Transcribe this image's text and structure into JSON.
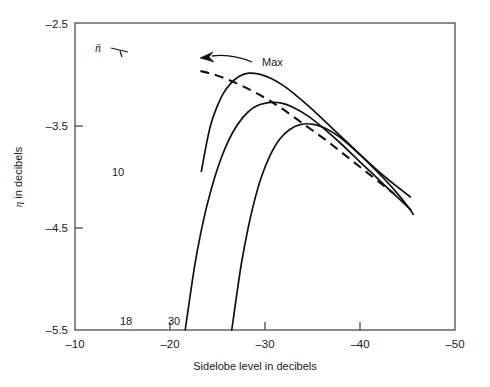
{
  "chart_data": {
    "type": "line",
    "title": "",
    "xlabel": "Sidelobe level in decibels",
    "ylabel": "η in decibels",
    "xlim": [
      -10,
      -50
    ],
    "ylim": [
      -5.5,
      -2.5
    ],
    "xticks": [
      -10,
      -20,
      -30,
      -40,
      -50
    ],
    "xtick_labels": [
      "–10",
      "–20",
      "–30",
      "–40",
      "–50"
    ],
    "yticks": [
      -2.5,
      -3.5,
      -4.5,
      -5.5
    ],
    "ytick_labels": [
      "–2.5",
      "–3.5",
      "–4.5",
      "–5.5"
    ],
    "grid": false,
    "legend_position": "inline-curve-labels",
    "parameter_symbol": "n̄",
    "series": [
      {
        "name": "10",
        "label": "10",
        "style": "solid",
        "points": [
          [
            -23.3,
            -3.95
          ],
          [
            -23.8,
            -3.7
          ],
          [
            -24.3,
            -3.49
          ],
          [
            -24.9,
            -3.33
          ],
          [
            -25.6,
            -3.19
          ],
          [
            -26.4,
            -3.09
          ],
          [
            -27.3,
            -3.02
          ],
          [
            -28.3,
            -2.99
          ],
          [
            -29.4,
            -3.0
          ],
          [
            -30.6,
            -3.04
          ],
          [
            -31.9,
            -3.11
          ],
          [
            -33.3,
            -3.21
          ],
          [
            -34.8,
            -3.33
          ],
          [
            -36.3,
            -3.46
          ],
          [
            -37.9,
            -3.6
          ],
          [
            -39.5,
            -3.74
          ],
          [
            -41.1,
            -3.88
          ],
          [
            -42.7,
            -4.01
          ],
          [
            -44.2,
            -4.12
          ],
          [
            -45.3,
            -4.2
          ]
        ]
      },
      {
        "name": "18",
        "label": "18",
        "style": "solid",
        "points": [
          [
            -21.6,
            -5.5
          ],
          [
            -22.1,
            -5.18
          ],
          [
            -22.6,
            -4.87
          ],
          [
            -23.2,
            -4.57
          ],
          [
            -23.9,
            -4.28
          ],
          [
            -24.7,
            -4.01
          ],
          [
            -25.6,
            -3.77
          ],
          [
            -26.6,
            -3.57
          ],
          [
            -27.7,
            -3.42
          ],
          [
            -28.9,
            -3.32
          ],
          [
            -30.2,
            -3.28
          ],
          [
            -31.6,
            -3.28
          ],
          [
            -33.1,
            -3.33
          ],
          [
            -34.7,
            -3.42
          ],
          [
            -36.3,
            -3.54
          ],
          [
            -38.0,
            -3.68
          ],
          [
            -39.7,
            -3.83
          ],
          [
            -41.4,
            -3.98
          ],
          [
            -43.1,
            -4.13
          ],
          [
            -44.6,
            -4.26
          ],
          [
            -45.4,
            -4.33
          ]
        ]
      },
      {
        "name": "30",
        "label": "30",
        "style": "solid",
        "points": [
          [
            -26.5,
            -5.5
          ],
          [
            -27.0,
            -5.17
          ],
          [
            -27.5,
            -4.86
          ],
          [
            -28.1,
            -4.56
          ],
          [
            -28.8,
            -4.27
          ],
          [
            -29.6,
            -4.01
          ],
          [
            -30.5,
            -3.8
          ],
          [
            -31.5,
            -3.64
          ],
          [
            -32.6,
            -3.54
          ],
          [
            -33.8,
            -3.49
          ],
          [
            -35.1,
            -3.49
          ],
          [
            -36.4,
            -3.53
          ],
          [
            -37.8,
            -3.61
          ],
          [
            -39.2,
            -3.72
          ],
          [
            -40.7,
            -3.85
          ],
          [
            -42.2,
            -3.99
          ],
          [
            -43.7,
            -4.14
          ],
          [
            -45.1,
            -4.3
          ],
          [
            -45.6,
            -4.37
          ]
        ]
      },
      {
        "name": "Max",
        "label": "Max",
        "style": "dashed",
        "points": [
          [
            -23.2,
            -2.97
          ],
          [
            -24.5,
            -3.0
          ],
          [
            -26.0,
            -3.05
          ],
          [
            -27.5,
            -3.11
          ],
          [
            -29.0,
            -3.18
          ],
          [
            -30.5,
            -3.26
          ],
          [
            -32.0,
            -3.35
          ],
          [
            -33.5,
            -3.45
          ],
          [
            -35.0,
            -3.55
          ],
          [
            -36.5,
            -3.65
          ],
          [
            -38.0,
            -3.76
          ],
          [
            -39.5,
            -3.87
          ],
          [
            -41.0,
            -3.98
          ],
          [
            -42.5,
            -4.09
          ],
          [
            -43.6,
            -4.17
          ]
        ]
      }
    ],
    "annotations": [
      {
        "name": "max-annotation",
        "text": "Max",
        "kind": "arrow-label"
      },
      {
        "name": "nbar-annotation",
        "text": "n̄",
        "kind": "parameter-pointer"
      }
    ]
  },
  "axes": {
    "x_label": "Sidelobe level in decibels",
    "y_label_prefix": "η",
    "y_label_suffix": " in decibels"
  },
  "curve_labels": {
    "ten": "10",
    "eighteen": "18",
    "thirty": "30"
  },
  "tick_text": {
    "x": [
      "–10",
      "–20",
      "–30",
      "–40",
      "–50"
    ],
    "y": [
      "–2.5",
      "–3.5",
      "–4.5",
      "–5.5"
    ]
  },
  "annotation_text": {
    "max": "Max",
    "nbar": "n̄"
  },
  "colors": {
    "ink": "#1a1a1a",
    "frame": "#4d4d4d",
    "background": "#ffffff"
  }
}
